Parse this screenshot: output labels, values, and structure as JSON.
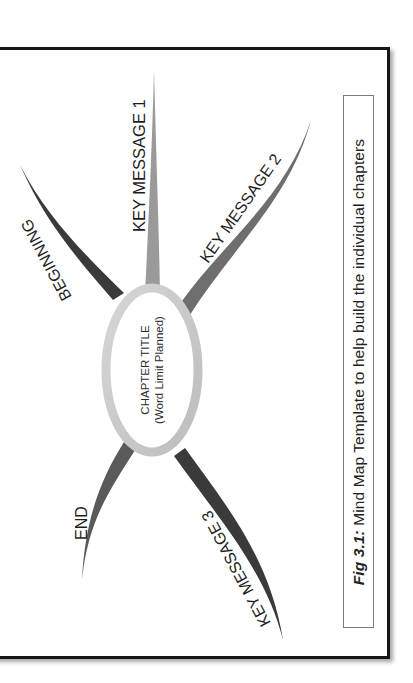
{
  "diagram": {
    "type": "mind_map",
    "orientation": "rotated 90deg counter-clockwise",
    "center": {
      "title": "CHAPTER TITLE",
      "subtitle": "(Word Limit Planned)"
    },
    "branches": [
      {
        "id": "beginning",
        "label": "BEGINNING",
        "color": "#3a3a3a"
      },
      {
        "id": "key-message-1",
        "label": "KEY MESSAGE 1",
        "color": "#9a9a9a"
      },
      {
        "id": "key-message-2",
        "label": "KEY MESSAGE 2",
        "color": "#6e6e6e"
      },
      {
        "id": "key-message-3",
        "label": "KEY MESSAGE 3",
        "color": "#3a3a3a"
      },
      {
        "id": "end",
        "label": "END",
        "color": "#5a5a5a"
      }
    ],
    "ellipse_color": "#c8c8c8"
  },
  "caption": {
    "fig_label": "Fig 3.1:",
    "text": " Mind Map Template to help build the individual chapters"
  },
  "colors": {
    "frame_border": "#161616",
    "caption_border": "#7a7a7a",
    "text": "#1e1e1e"
  }
}
